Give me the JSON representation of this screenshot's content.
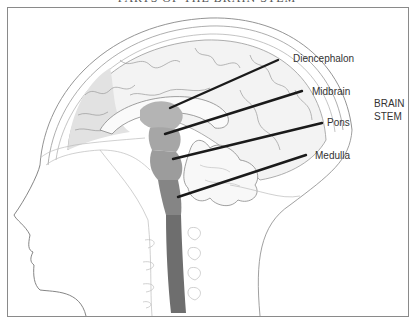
{
  "title": "PARTS OF THE BRAIN STEM",
  "labels": {
    "diencephalon": "Diencephalon",
    "midbrain": "Midbrain",
    "pons": "Pons",
    "medulla": "Medulla"
  },
  "group_label": {
    "line1": "BRAIN",
    "line2": "STEM"
  },
  "colors": {
    "diencephalon": "#b4b4b4",
    "midbrain": "#a6a6a6",
    "pons": "#9c9c9c",
    "medulla": "#858585",
    "spinal_cord": "#6e6e6e",
    "cortex_shade": "#e6e6e6",
    "outline": "#777777",
    "leader_line": "#1a1a1a"
  }
}
